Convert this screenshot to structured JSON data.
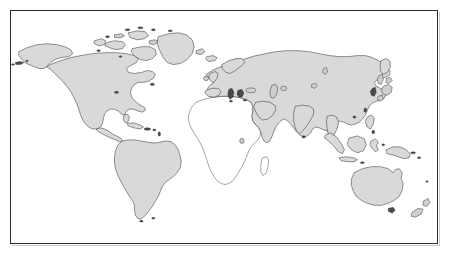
{
  "document": {
    "type": "world-map-figure",
    "title": "World map outline",
    "projection_note": "equirectangular-style world outline",
    "width": 449,
    "height": 257
  },
  "frame": {
    "name": "map-border",
    "border_color": "#2b2b2b",
    "background_color": "#ffffff",
    "shadow_color": "#c9c9c9",
    "left": 10,
    "top": 10,
    "width": 428,
    "height": 234
  },
  "styles": {
    "land_fill": "#d9d9d9",
    "land_stroke": "#3a3a3a",
    "unfilled_land_fill": "#ffffff",
    "unfilled_land_stroke": "#4a4a4a",
    "ocean_fill": "#ffffff",
    "islet_fill": "#cfcfcf",
    "islet_dark_fill": "#4a4a4a"
  },
  "legend_note": "Africa is drawn as an unshaded (white) outline; all other landmasses are shaded light gray.",
  "regions": [
    {
      "name": "north-america",
      "label": "North America",
      "shaded": true,
      "includes": [
        "Alaska",
        "Canada",
        "United States",
        "Mexico",
        "Central America"
      ]
    },
    {
      "name": "greenland",
      "label": "Greenland",
      "shaded": true,
      "includes": [
        "Greenland"
      ]
    },
    {
      "name": "canadian-arctic",
      "label": "Canadian Arctic Archipelago",
      "shaded": true,
      "includes": [
        "Baffin Island",
        "Ellesmere Island",
        "Victoria Island",
        "Banks Island"
      ]
    },
    {
      "name": "south-america",
      "label": "South America",
      "shaded": true,
      "includes": [
        "Colombia",
        "Brazil",
        "Peru",
        "Argentina",
        "Chile"
      ]
    },
    {
      "name": "caribbean",
      "label": "Caribbean Islands",
      "shaded": true,
      "includes": [
        "Cuba",
        "Hispaniola",
        "Lesser Antilles"
      ]
    },
    {
      "name": "africa",
      "label": "Africa",
      "shaded": false,
      "includes": [
        "Sahara",
        "West Africa",
        "Horn of Africa",
        "Southern Africa",
        "Madagascar"
      ]
    },
    {
      "name": "eurasia",
      "label": "Eurasia",
      "shaded": true,
      "includes": [
        "Europe",
        "Russia",
        "Middle East",
        "Arabian Peninsula",
        "India",
        "China",
        "Southeast Asia"
      ]
    },
    {
      "name": "british-isles",
      "label": "British Isles",
      "shaded": true,
      "includes": [
        "Great Britain",
        "Ireland"
      ]
    },
    {
      "name": "iceland",
      "label": "Iceland",
      "shaded": true,
      "includes": [
        "Iceland"
      ]
    },
    {
      "name": "japan",
      "label": "Japan",
      "shaded": true,
      "includes": [
        "Honshu",
        "Hokkaido",
        "Kyushu"
      ]
    },
    {
      "name": "indonesia",
      "label": "Indonesian Archipelago",
      "shaded": true,
      "includes": [
        "Sumatra",
        "Java",
        "Borneo",
        "Sulawesi",
        "Philippines"
      ]
    },
    {
      "name": "new-guinea",
      "label": "New Guinea",
      "shaded": true,
      "includes": [
        "Papua New Guinea"
      ]
    },
    {
      "name": "australia",
      "label": "Australia",
      "shaded": true,
      "includes": [
        "Australia",
        "Tasmania"
      ]
    },
    {
      "name": "new-zealand",
      "label": "New Zealand",
      "shaded": true,
      "includes": [
        "North Island",
        "South Island"
      ]
    },
    {
      "name": "madagascar",
      "label": "Madagascar",
      "shaded": false,
      "includes": [
        "Madagascar"
      ]
    }
  ]
}
